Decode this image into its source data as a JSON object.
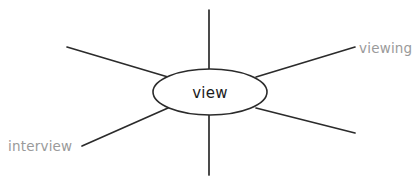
{
  "diagram": {
    "type": "word-association-mind-map",
    "background_color": "#ffffff",
    "line_color": "#2b2b2b",
    "center": {
      "label": "view",
      "text_color": "#1c1c1c",
      "shape": "ellipse",
      "cx": 210,
      "cy": 92,
      "rx": 57,
      "ry": 23
    },
    "labels": {
      "top_right": "viewing",
      "bottom_left": "interview",
      "label_color": "#9a9a9a"
    },
    "spokes": [
      {
        "name": "spoke-up",
        "x1": 209,
        "y1": 10,
        "x2": 209,
        "y2": 70,
        "labelled": false
      },
      {
        "name": "spoke-down",
        "x1": 209,
        "y1": 114,
        "x2": 209,
        "y2": 175,
        "labelled": false
      },
      {
        "name": "spoke-upper-left",
        "x1": 67,
        "y1": 47,
        "x2": 168,
        "y2": 77,
        "labelled": false
      },
      {
        "name": "spoke-upper-right",
        "x1": 355,
        "y1": 47,
        "x2": 256,
        "y2": 77,
        "labelled": true
      },
      {
        "name": "spoke-lower-left",
        "x1": 82,
        "y1": 146,
        "x2": 168,
        "y2": 108,
        "labelled": true
      },
      {
        "name": "spoke-lower-right",
        "x1": 355,
        "y1": 133,
        "x2": 256,
        "y2": 108,
        "labelled": false
      }
    ]
  }
}
